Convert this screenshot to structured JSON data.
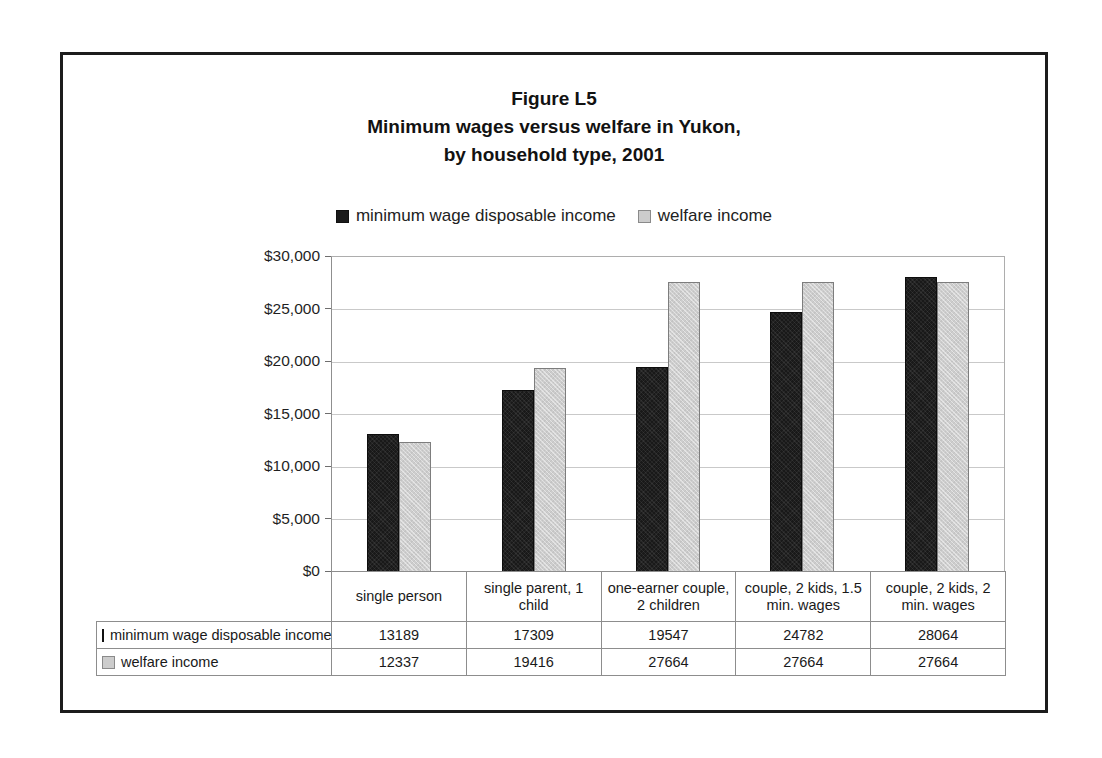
{
  "figure": {
    "title_lines": [
      "Figure L5",
      "Minimum wages versus welfare in Yukon,",
      "by household type, 2001"
    ]
  },
  "chart_data": {
    "type": "bar",
    "xlabel": "",
    "ylabel": "",
    "ylim": [
      0,
      30000
    ],
    "ytick_values": [
      0,
      5000,
      10000,
      15000,
      20000,
      25000,
      30000
    ],
    "ytick_labels": [
      "$0",
      "$5,000",
      "$10,000",
      "$15,000",
      "$20,000",
      "$25,000",
      "$30,000"
    ],
    "grid": true,
    "legend_position": "top-center",
    "categories": [
      "single person",
      "single parent, 1 child",
      "one-earner couple, 2 children",
      "couple, 2 kids, 1.5 min. wages",
      "couple, 2 kids, 2 min. wages"
    ],
    "series": [
      {
        "name": "minimum wage disposable income",
        "color": "#191919",
        "values": [
          13189,
          17309,
          19547,
          24782,
          28064
        ]
      },
      {
        "name": "welfare income",
        "color": "#cdcdcd",
        "values": [
          12337,
          19416,
          27664,
          27664,
          27664
        ]
      }
    ]
  },
  "table": {
    "rows": [
      {
        "label": "minimum wage disposable income",
        "swatch": "dark-square-icon",
        "cells": [
          "13189",
          "17309",
          "19547",
          "24782",
          "28064"
        ]
      },
      {
        "label": "welfare income",
        "swatch": "light-square-icon",
        "cells": [
          "12337",
          "19416",
          "27664",
          "27664",
          "27664"
        ]
      }
    ]
  }
}
